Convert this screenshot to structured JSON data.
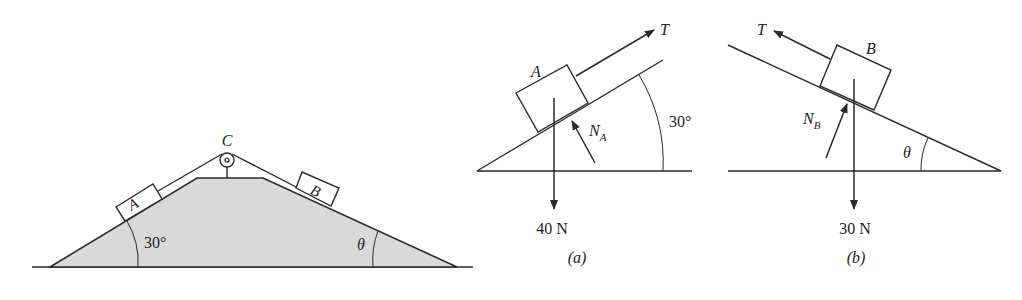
{
  "figure_main": {
    "pulley_label": "C",
    "block_a_label": "A",
    "block_b_label": "B",
    "left_angle": "30°",
    "right_angle": "θ"
  },
  "figure_a": {
    "block_label": "A",
    "tension_label": "T",
    "normal_label": "N",
    "normal_subscript": "A",
    "angle_label": "30°",
    "weight_label": "40 N",
    "caption": "(a)"
  },
  "figure_b": {
    "block_label": "B",
    "tension_label": "T",
    "normal_label": "N",
    "normal_subscript": "B",
    "angle_label": "θ",
    "weight_label": "30 N",
    "caption": "(b)"
  },
  "colors": {
    "stroke": "#2a2a2a",
    "fill_ground": "#d9d9d9"
  }
}
